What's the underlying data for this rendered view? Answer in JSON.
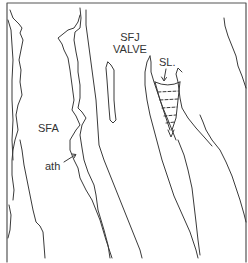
{
  "diagram": {
    "labels": {
      "sfj_line1": "SFJ",
      "sfj_line2": "VALVE",
      "sfa": "SFA",
      "ath": "ath",
      "sl": "SL."
    },
    "colors": {
      "line": "#3a3a3a",
      "frame": "#555555",
      "background": "#ffffff"
    }
  }
}
